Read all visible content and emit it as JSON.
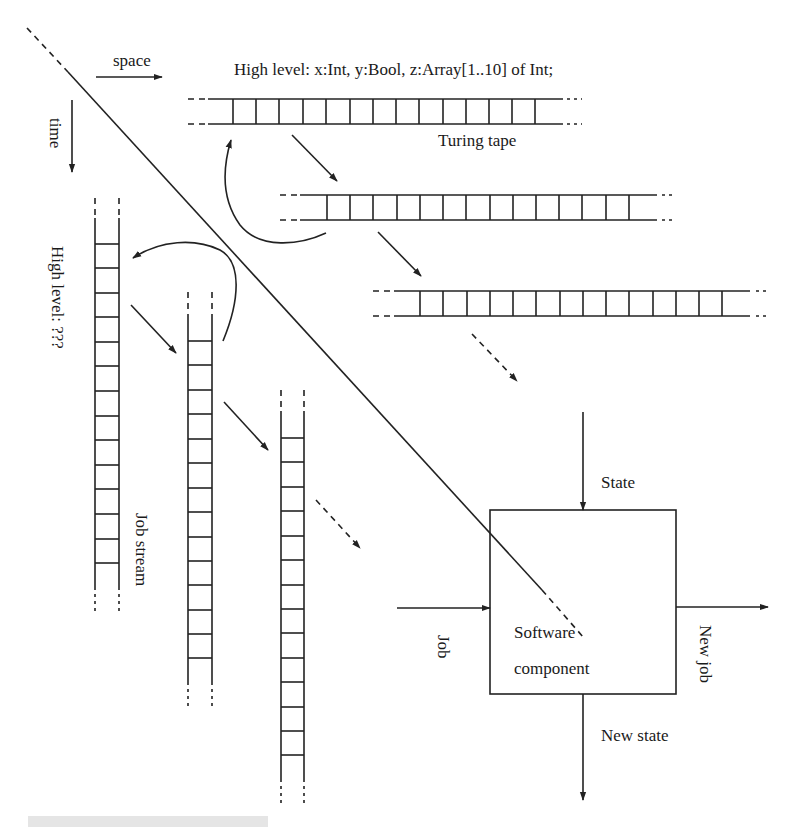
{
  "diagram": {
    "axes": {
      "space_label": "space",
      "time_label": "time"
    },
    "turing_tape": {
      "high_level_label": "High level: x:Int, y:Bool, z:Array[1..10] of Int;",
      "tape_label": "Turing tape"
    },
    "job_stream": {
      "high_level_label": "High level: ???",
      "stream_label": "Job stream"
    },
    "component": {
      "box_label_line1": "Software",
      "box_label_line2": "component",
      "input_state": "State",
      "input_job": "Job",
      "output_job": "New job",
      "output_state": "New state"
    },
    "colors": {
      "ink": "#222222",
      "background": "#ffffff"
    }
  }
}
